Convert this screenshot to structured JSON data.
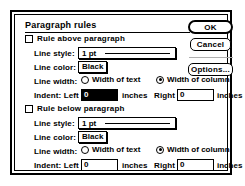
{
  "dialog": {
    "title": "Paragraph rules",
    "buttons": {
      "ok": "OK",
      "cancel": "Cancel",
      "options": "Options..."
    }
  },
  "sections": [
    {
      "id": "above",
      "enable_label": "Rule above paragraph",
      "enabled": false,
      "line_style_label": "Line style:",
      "line_style_value": "1 pt",
      "line_color_label": "Line color:",
      "line_color_value": "Black",
      "line_width_label": "Line width:",
      "width_of_text_label": "Width of text",
      "width_of_column_label": "Width of column",
      "width_selected": "column",
      "indent_left_label": "Indent: Left",
      "indent_left_value": "0",
      "indent_left_selected": true,
      "indent_left_unit": "inches",
      "indent_right_label": "Right",
      "indent_right_value": "0",
      "indent_right_unit": "inches"
    },
    {
      "id": "below",
      "enable_label": "Rule below paragraph",
      "enabled": false,
      "line_style_label": "Line style:",
      "line_style_value": "1 pt",
      "line_color_label": "Line color:",
      "line_color_value": "Black",
      "line_width_label": "Line width:",
      "width_of_text_label": "Width of text",
      "width_of_column_label": "Width of column",
      "width_selected": "column",
      "indent_left_label": "Indent: Left",
      "indent_left_value": "0",
      "indent_left_selected": false,
      "indent_left_unit": "inches",
      "indent_right_label": "Right",
      "indent_right_value": "0",
      "indent_right_unit": "inches"
    }
  ],
  "colors": {
    "window_bg": "#ffffff",
    "border": "#000000",
    "selection": "#000000",
    "selection_text": "#ffffff"
  }
}
